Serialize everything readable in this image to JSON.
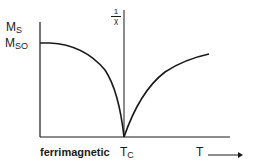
{
  "diagram": {
    "y_axis_label_main": "M",
    "y_axis_label_sub": "S",
    "y_axis_value_main": "M",
    "y_axis_value_sub": "SO",
    "secondary_axis_label_num": "1",
    "secondary_axis_label_den": "χ",
    "x_region_label": "ferrimagnetic",
    "critical_temp_main": "T",
    "critical_temp_sub": "C",
    "x_axis_label": "T",
    "x_axis_arrow": "⟶",
    "colors": {
      "line": "#1a1a1a",
      "background": "#ffffff"
    },
    "curves": [
      {
        "name": "saturation-magnetization",
        "description": "Ms falls from Mso at T=0 to zero at Tc"
      },
      {
        "name": "inverse-susceptibility",
        "description": "1/χ rises from zero at Tc, concave down"
      }
    ]
  }
}
